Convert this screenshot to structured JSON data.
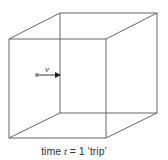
{
  "figure": {
    "type": "cube-wireframe",
    "colors": {
      "edge": "#555555",
      "particle": "#888888",
      "arrow": "#222222",
      "text": "#333333"
    },
    "vertices": {
      "front_top_left": [
        9,
        39
      ],
      "front_top_right": [
        106,
        39
      ],
      "front_bottom_left": [
        9,
        138
      ],
      "front_bottom_right": [
        106,
        138
      ],
      "back_top_left": [
        60,
        13
      ],
      "back_top_right": [
        157,
        13
      ],
      "back_bottom_left": [
        60,
        113
      ],
      "back_bottom_right": [
        157,
        113
      ]
    },
    "particle": {
      "position": [
        37,
        75
      ],
      "velocity_label": "v",
      "arrow_end": [
        60,
        75
      ]
    }
  },
  "caption": {
    "prefix": "time ",
    "variable": "t",
    "suffix": " = 1 ‘trip’"
  }
}
